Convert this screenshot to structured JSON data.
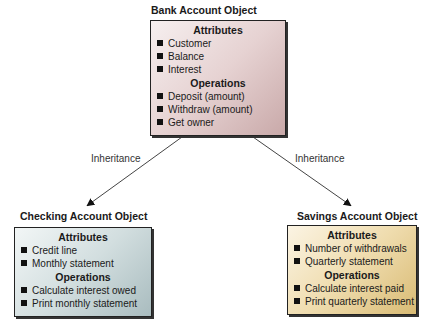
{
  "bank": {
    "title": "Bank Account Object",
    "attributes_header": "Attributes",
    "attributes": [
      "Customer",
      "Balance",
      "Interest"
    ],
    "operations_header": "Operations",
    "operations": [
      "Deposit (amount)",
      "Withdraw (amount)",
      "Get owner"
    ]
  },
  "checking": {
    "title": "Checking Account Object",
    "attributes_header": "Attributes",
    "attributes": [
      "Credit line",
      "Monthly statement"
    ],
    "operations_header": "Operations",
    "operations": [
      "Calculate interest owed",
      "Print monthly statement"
    ]
  },
  "savings": {
    "title": "Savings Account Object",
    "attributes_header": "Attributes",
    "attributes": [
      "Number of withdrawals",
      "Quarterly statement"
    ],
    "operations_header": "Operations",
    "operations": [
      "Calculate interest paid",
      "Print quarterly statement"
    ]
  },
  "edges": {
    "left_label": "Inheritance",
    "right_label": "Inheritance"
  }
}
